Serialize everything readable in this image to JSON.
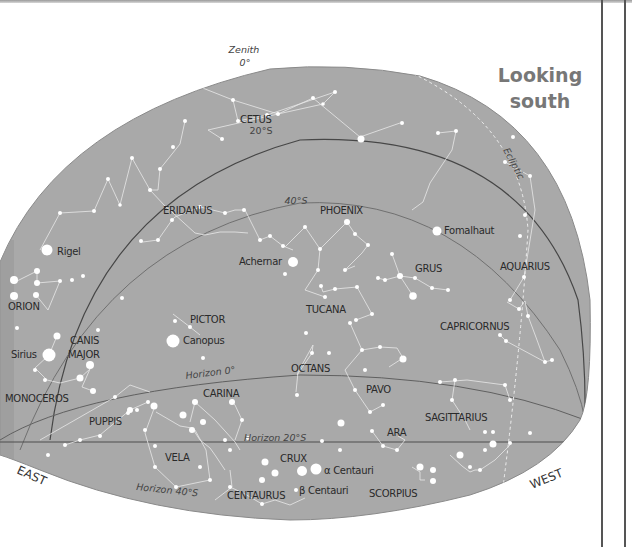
{
  "title": {
    "line1": "Looking",
    "line2": "south"
  },
  "colors": {
    "dome": "#a9a9a9",
    "dome_edge": "#888888",
    "line_dark": "#4a4a4a",
    "line_mid": "#6f6f6f",
    "star": "#ffffff",
    "constellation_line": "#e9e9e9",
    "title": "#777777"
  },
  "markers": {
    "zenith": "Zenith",
    "zenith_deg": "0°",
    "alt20": "20°S",
    "alt40": "40°S",
    "ecliptic": "Ecliptic",
    "horizon0": "Horizon 0°",
    "horizon20": "Horizon 20°S",
    "horizon40": "Horizon 40°S",
    "east": "EAST",
    "west": "WEST"
  },
  "constellations": [
    {
      "name": "CETUS",
      "x": 240,
      "y": 123
    },
    {
      "name": "ERIDANUS",
      "x": 163,
      "y": 214
    },
    {
      "name": "PHOENIX",
      "x": 320,
      "y": 214
    },
    {
      "name": "GRUS",
      "x": 415,
      "y": 272
    },
    {
      "name": "AQUARIUS",
      "x": 500,
      "y": 270
    },
    {
      "name": "TUCANA",
      "x": 306,
      "y": 313
    },
    {
      "name": "CAPRICORNUS",
      "x": 440,
      "y": 330
    },
    {
      "name": "ORION",
      "x": 8,
      "y": 310
    },
    {
      "name": "PICTOR",
      "x": 190,
      "y": 323
    },
    {
      "name": "CANIS",
      "x": 70,
      "y": 344
    },
    {
      "name": "MAJOR",
      "x": 68,
      "y": 358
    },
    {
      "name": "OCTANS",
      "x": 291,
      "y": 372
    },
    {
      "name": "PAVO",
      "x": 366,
      "y": 393
    },
    {
      "name": "CARINA",
      "x": 203,
      "y": 397
    },
    {
      "name": "MONOCEROS",
      "x": 5,
      "y": 402
    },
    {
      "name": "SAGITTARIUS",
      "x": 425,
      "y": 421
    },
    {
      "name": "PUPPIS",
      "x": 89,
      "y": 425
    },
    {
      "name": "ARA",
      "x": 387,
      "y": 436
    },
    {
      "name": "VELA",
      "x": 165,
      "y": 461
    },
    {
      "name": "CRUX",
      "x": 280,
      "y": 462
    },
    {
      "name": "CENTAURUS",
      "x": 227,
      "y": 499
    },
    {
      "name": "SCORPIUS",
      "x": 369,
      "y": 497
    }
  ],
  "named_stars": [
    {
      "name": "Rigel",
      "x": 57,
      "y": 255,
      "sx": 47,
      "sy": 250,
      "r": 5.5
    },
    {
      "name": "Achernar",
      "x": 239,
      "y": 265,
      "sx": 293,
      "sy": 262,
      "r": 5
    },
    {
      "name": "Fomalhaut",
      "x": 444,
      "y": 234,
      "sx": 437,
      "sy": 231,
      "r": 4.5
    },
    {
      "name": "Sirius",
      "x": 10,
      "y": 358,
      "sx": 49,
      "sy": 355,
      "r": 6.5
    },
    {
      "name": "Canopus",
      "x": 183,
      "y": 344,
      "sx": 173,
      "sy": 341,
      "r": 6.5
    },
    {
      "name": "α Centauri",
      "x": 324,
      "y": 474,
      "sx": 316,
      "sy": 469,
      "r": 5.5
    },
    {
      "name": "β Centauri",
      "x": 299,
      "y": 494,
      "sx": 302,
      "sy": 471,
      "r": 5
    }
  ]
}
